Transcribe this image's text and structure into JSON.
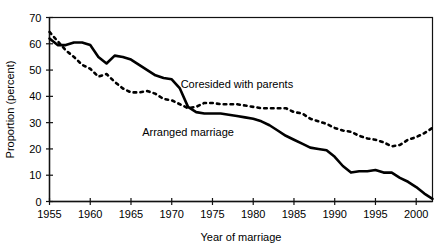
{
  "chart_data": {
    "type": "line",
    "title": "",
    "subtitle": "",
    "xlabel": "Year of marriage",
    "ylabel": "Proportion (percent)",
    "xlim": [
      1955,
      2002
    ],
    "ylim": [
      0,
      70
    ],
    "grid": false,
    "legend_position": "inline-annotation",
    "x_ticks": [
      1955,
      1960,
      1965,
      1970,
      1975,
      1980,
      1985,
      1990,
      1995,
      2000
    ],
    "x_tick_labels": [
      "1955",
      "1960",
      "1965",
      "1970",
      "1975",
      "1980",
      "1985",
      "1990",
      "1995",
      "2000"
    ],
    "y_ticks": [
      0,
      10,
      20,
      30,
      40,
      50,
      60,
      70
    ],
    "y_tick_labels": [
      "0",
      "10",
      "20",
      "30",
      "40",
      "50",
      "60",
      "70"
    ],
    "x": [
      1955,
      1956,
      1957,
      1958,
      1959,
      1960,
      1961,
      1962,
      1963,
      1964,
      1965,
      1966,
      1967,
      1968,
      1969,
      1970,
      1971,
      1972,
      1973,
      1974,
      1975,
      1976,
      1977,
      1978,
      1979,
      1980,
      1981,
      1982,
      1983,
      1984,
      1985,
      1986,
      1987,
      1988,
      1989,
      1990,
      1991,
      1992,
      1993,
      1994,
      1995,
      1996,
      1997,
      1998,
      1999,
      2000,
      2001,
      2002
    ],
    "series": [
      {
        "name": "Arranged marriage",
        "style": "solid",
        "color": "#000000",
        "label_x": 1972,
        "label_y": 25,
        "values": [
          62.0,
          59.5,
          59.5,
          60.5,
          60.5,
          59.5,
          55.0,
          52.5,
          55.5,
          55.0,
          54.0,
          52.0,
          50.0,
          48.0,
          47.0,
          46.5,
          43.0,
          36.0,
          34.0,
          33.5,
          33.5,
          33.5,
          33.0,
          32.5,
          32.0,
          31.5,
          30.5,
          29.0,
          27.0,
          25.0,
          23.5,
          22.0,
          20.5,
          20.0,
          19.5,
          17.0,
          13.5,
          11.0,
          11.5,
          11.5,
          12.0,
          11.0,
          11.0,
          9.0,
          7.5,
          5.5,
          3.0,
          1.0
        ]
      },
      {
        "name": "Coresided with parents",
        "style": "dotted",
        "color": "#000000",
        "label_x": 1978,
        "label_y": 43,
        "values": [
          64.5,
          61.0,
          57.5,
          55.0,
          52.0,
          50.5,
          47.5,
          48.5,
          45.5,
          43.0,
          41.5,
          41.5,
          42.0,
          41.0,
          39.0,
          38.5,
          37.0,
          35.5,
          36.0,
          37.5,
          37.5,
          37.0,
          37.0,
          37.0,
          36.5,
          36.0,
          35.5,
          35.5,
          35.5,
          35.5,
          34.0,
          33.5,
          31.5,
          30.5,
          29.5,
          28.0,
          27.0,
          26.5,
          25.0,
          24.0,
          23.5,
          22.5,
          21.0,
          21.5,
          23.5,
          24.5,
          26.0,
          28.0
        ]
      }
    ]
  }
}
